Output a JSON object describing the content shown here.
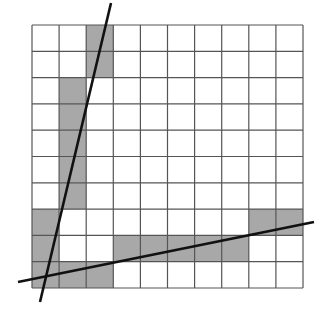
{
  "diagram": {
    "type": "pixel-grid-line-rasterization",
    "grid": {
      "cols": 10,
      "rows": 10,
      "left": 32,
      "top": 25,
      "cell_w": 27.1,
      "cell_h": 26.3
    },
    "colors": {
      "shade": "#a8a8a8",
      "grid": "#555555",
      "line": "#111111",
      "background": "#ffffff"
    },
    "shaded_cells": [
      [
        2,
        0
      ],
      [
        2,
        1
      ],
      [
        1,
        2
      ],
      [
        1,
        3
      ],
      [
        1,
        4
      ],
      [
        1,
        5
      ],
      [
        1,
        6
      ],
      [
        0,
        7
      ],
      [
        0,
        8
      ],
      [
        0,
        9
      ],
      [
        1,
        9
      ],
      [
        2,
        9
      ],
      [
        3,
        8
      ],
      [
        4,
        8
      ],
      [
        5,
        8
      ],
      [
        6,
        8
      ],
      [
        7,
        8
      ],
      [
        8,
        7
      ],
      [
        9,
        7
      ]
    ],
    "lines": [
      {
        "name": "steep-line",
        "x1": 111,
        "y1": 3,
        "x2": 40,
        "y2": 302
      },
      {
        "name": "shallow-line",
        "x1": 18,
        "y1": 282,
        "x2": 314,
        "y2": 222
      }
    ]
  }
}
